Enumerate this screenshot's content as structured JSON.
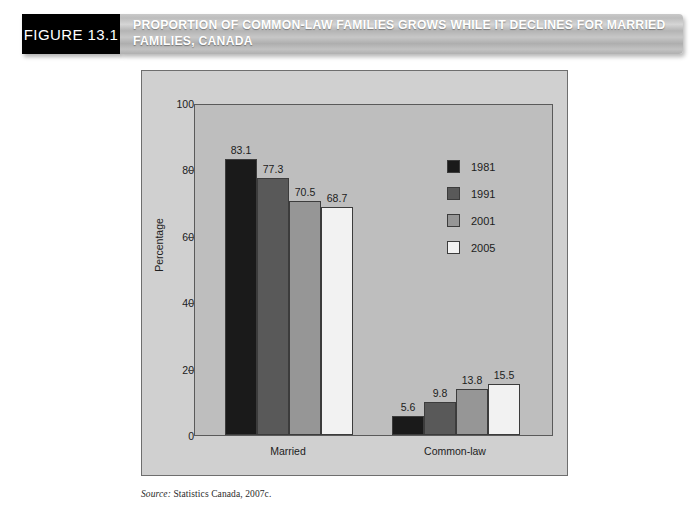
{
  "header": {
    "figure_tag": "FIGURE 13.1",
    "title": "PROPORTION OF COMMON-LAW FAMILIES GROWS WHILE IT DECLINES FOR MARRIED FAMILIES, CANADA"
  },
  "source": {
    "prefix": "Source:",
    "text": " Statistics Canada, 2007c."
  },
  "colors": {
    "series_1981": "#1a1a1a",
    "series_1991": "#595959",
    "series_2001": "#969696",
    "series_2005": "#f2f2f2",
    "plot_background": "#bebebe",
    "panel_background": "#d0d0d0",
    "axis": "#4a4a4a"
  },
  "chart_data": {
    "type": "bar",
    "title": "PROPORTION OF COMMON-LAW FAMILIES GROWS WHILE IT DECLINES FOR MARRIED FAMILIES, CANADA",
    "xlabel": "",
    "ylabel": "Percentage",
    "ylim": [
      0,
      100
    ],
    "yticks": [
      0,
      20,
      40,
      60,
      80,
      100
    ],
    "ytick_labels": [
      "0",
      "20",
      "40",
      "60",
      "80",
      "100"
    ],
    "grid": false,
    "legend_position": "upper right inside",
    "categories": [
      "Married",
      "Common-law"
    ],
    "series": [
      {
        "name": "1981",
        "color": "#1a1a1a",
        "values": [
          83.1,
          5.6
        ]
      },
      {
        "name": "1991",
        "color": "#595959",
        "values": [
          77.3,
          9.8
        ]
      },
      {
        "name": "2001",
        "color": "#969696",
        "values": [
          70.5,
          13.8
        ]
      },
      {
        "name": "2005",
        "color": "#f2f2f2",
        "values": [
          68.7,
          15.5
        ]
      }
    ],
    "value_labels": [
      [
        "83.1",
        "77.3",
        "70.5",
        "68.7"
      ],
      [
        "5.6",
        "9.8",
        "13.8",
        "15.5"
      ]
    ]
  }
}
